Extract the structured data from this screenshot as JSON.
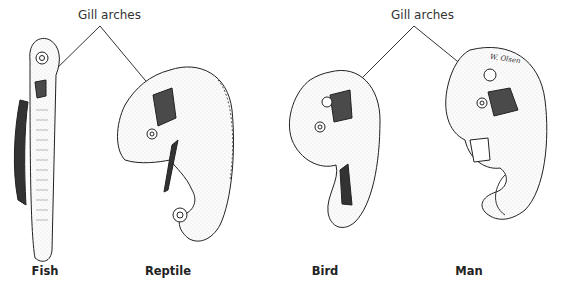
{
  "figure": {
    "callouts": [
      {
        "text": "Gill arches",
        "x": 78,
        "y": 8,
        "targets": [
          "Fish",
          "Reptile"
        ]
      },
      {
        "text": "Gill arches",
        "x": 391,
        "y": 8,
        "targets": [
          "Bird",
          "Man"
        ]
      }
    ],
    "embryos": [
      {
        "label": "Fish",
        "x": 45
      },
      {
        "label": "Reptile",
        "x": 168
      },
      {
        "label": "Bird",
        "x": 325
      },
      {
        "label": "Man",
        "x": 469
      }
    ],
    "artist_signature": "W. Olsen",
    "colors": {
      "ink": "#222222",
      "gill_fill": "#4a4a4a",
      "background": "#ffffff",
      "body_fill": "#f7f7f7"
    }
  }
}
